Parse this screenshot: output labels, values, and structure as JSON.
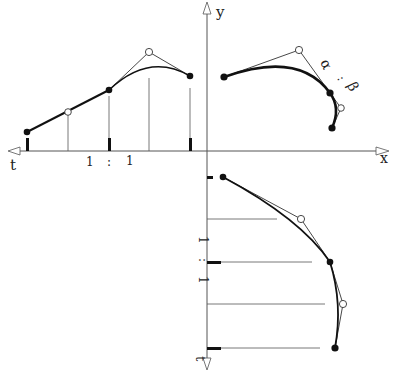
{
  "diagram": {
    "axes": {
      "x_label": "x",
      "y_label": "y",
      "t_label_left": "t",
      "t_label_bottom": "t"
    },
    "ratios": {
      "left": {
        "a": "1",
        "sep": ":",
        "b": "1"
      },
      "bottom": {
        "a": "1",
        "sep": ":",
        "b": "1"
      },
      "curve": {
        "a": "α",
        "sep": ":",
        "b": "β"
      }
    },
    "colors": {
      "ink": "#111111",
      "thin_line": "#444444",
      "background": "#ffffff"
    }
  }
}
